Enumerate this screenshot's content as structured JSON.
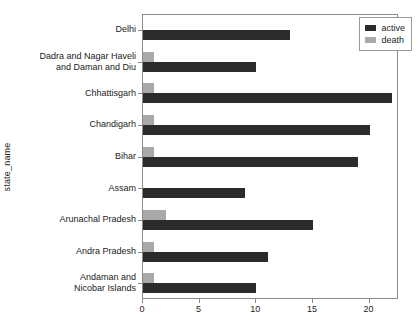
{
  "chart_data": {
    "type": "bar",
    "orientation": "horizontal",
    "title": "",
    "xlabel": "",
    "ylabel": "state_name",
    "xlim": [
      0,
      22.6
    ],
    "xticks": [
      0,
      5,
      10,
      15,
      20
    ],
    "grid": false,
    "legend": {
      "position": "top-right",
      "entries": [
        "active",
        "death"
      ]
    },
    "colors": {
      "active": "#2b2b2b",
      "death": "#a9a9a9",
      "axis": "#8a8a8a",
      "text": "#222222",
      "background": "#ffffff"
    },
    "categories": [
      "Delhi",
      "Dadra and Nagar Haveli and Daman and Diu",
      "Chhattisgarh",
      "Chandigarh",
      "Bihar",
      "Assam",
      "Arunachal Pradesh",
      "Andra Pradesh",
      "Andaman and Nicobar Islands"
    ],
    "category_lines": [
      [
        "Delhi"
      ],
      [
        "Dadra and Nagar Haveli",
        "and Daman and Diu"
      ],
      [
        "Chhattisgarh"
      ],
      [
        "Chandigarh"
      ],
      [
        "Bihar"
      ],
      [
        "Assam"
      ],
      [
        "Arunachal Pradesh"
      ],
      [
        "Andra Pradesh"
      ],
      [
        "Andaman and",
        "Nicobar Islands"
      ]
    ],
    "series": [
      {
        "name": "active",
        "values": [
          13,
          10,
          22,
          20,
          19,
          9,
          15,
          11,
          10
        ]
      },
      {
        "name": "death",
        "values": [
          0,
          1,
          1,
          1,
          1,
          0,
          2,
          1,
          1
        ]
      }
    ]
  }
}
